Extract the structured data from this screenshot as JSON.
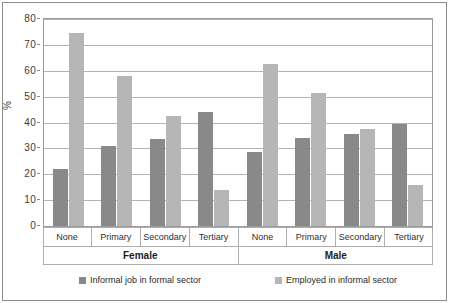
{
  "chart_data": {
    "type": "bar",
    "title": "",
    "subtitle": "",
    "xlabel": "",
    "ylabel": "%",
    "ylim": [
      0,
      80
    ],
    "ytick_step": 10,
    "yticks": [
      0,
      10,
      20,
      30,
      40,
      50,
      60,
      70,
      80
    ],
    "ytick_labels": [
      "0",
      "10",
      "20",
      "30",
      "40",
      "50",
      "60",
      "70",
      "80"
    ],
    "grid": true,
    "grid_axis": "y",
    "legend_position": "bottom",
    "groups": [
      "Female",
      "Male"
    ],
    "categories": [
      "None",
      "Primary",
      "Secondary",
      "Tertiary",
      "None",
      "Primary",
      "Secondary",
      "Tertiary"
    ],
    "group_spans": [
      4,
      4
    ],
    "series": [
      {
        "name": "Informal job in formal sector",
        "color": "#898989",
        "values": [
          22,
          31,
          33.5,
          44,
          28.5,
          34,
          35.5,
          39.5
        ]
      },
      {
        "name": "Employed in informal sector",
        "color": "#b6b6b6",
        "values": [
          74.5,
          58,
          42.5,
          14,
          62.5,
          51.5,
          37.5,
          16
        ]
      }
    ],
    "colors": {
      "series_0": "#898989",
      "series_1": "#b6b6b6",
      "gridline": "#b4b4b4",
      "axis": "#9a9a9a",
      "frame": "#8c8c8c",
      "background": "#ffffff",
      "text": "#2b2b2b"
    }
  }
}
